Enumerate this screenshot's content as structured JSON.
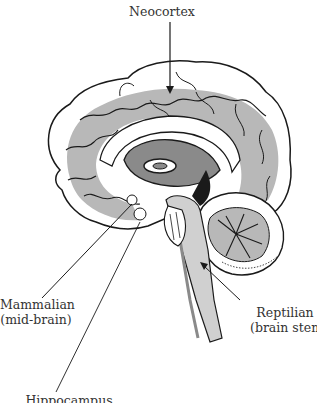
{
  "diagram": {
    "type": "anatomical-illustration",
    "labels": {
      "neocortex": "Neocortex",
      "mammalian_line1": "Mammalian",
      "mammalian_line2": "(mid-brain)",
      "reptilian_line1": "Reptilian",
      "reptilian_line2": "(brain stem)",
      "hippocampus": "Hippocampus"
    },
    "colors": {
      "outline": "#1a1a1a",
      "shade": "#b8b8b8",
      "dark_shade": "#8a8a8a",
      "text": "#333333",
      "background": "#ffffff"
    }
  }
}
